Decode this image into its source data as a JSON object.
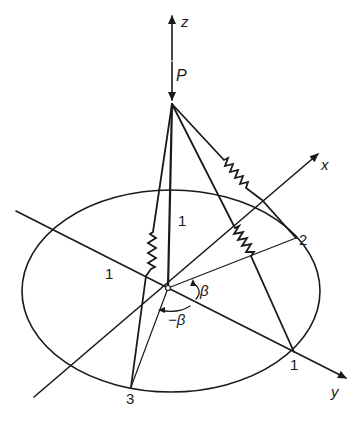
{
  "figure": {
    "colors": {
      "ink": "#1a1a1a",
      "background": "#ffffff"
    },
    "axes": {
      "z_label": "z",
      "x_label": "x",
      "y_label": "y"
    },
    "load": {
      "label": "P"
    },
    "members": {
      "vertical_member_label": "1",
      "left_member_label": "1"
    },
    "nodes": {
      "node_2_label": "2",
      "node_1_label": "1",
      "node_3_label": "3"
    },
    "angles": {
      "beta_label": "β",
      "neg_beta_label": "−β"
    }
  }
}
